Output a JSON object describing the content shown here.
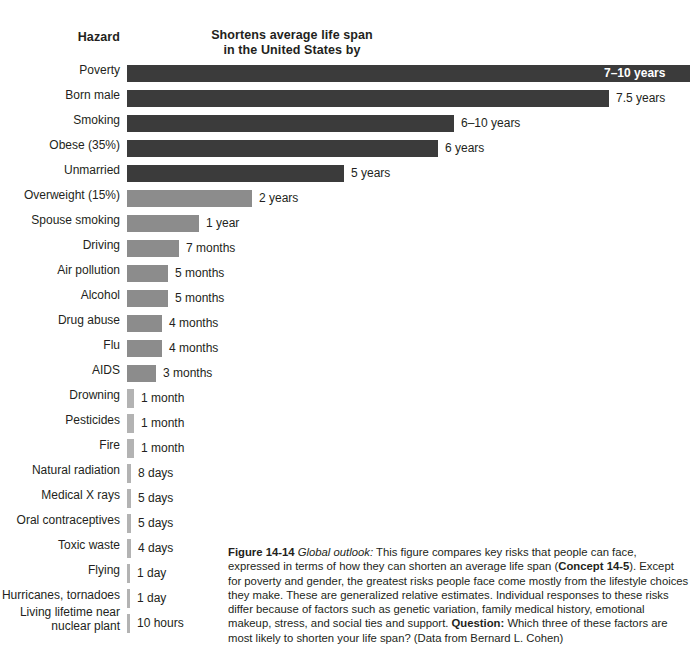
{
  "header": {
    "hazard_label": "Hazard",
    "axis_label_line1": "Shortens average life span",
    "axis_label_line2": "in the United States by"
  },
  "colors": {
    "dark_bar": "#3b3b3b",
    "mid_bar": "#8c8c8c",
    "light_bar": "#b3b3b3",
    "text": "#231f20",
    "inside_label": "#ffffff",
    "background": "#ffffff"
  },
  "caption": {
    "figure_number": "Figure 14-14",
    "lead_italic": "Global outlook:",
    "text_part1": " This figure compares key risks that people can face, expressed in terms of how they can shorten an average life span (",
    "concept_ref": "Concept 14-5",
    "text_part2": "). Except for poverty and gender, the greatest risks people face come mostly from the lifestyle choices they make. These are generalized relative estimates. Individual responses to these risks differ because of factors such as genetic variation, family medical history, emotional makeup, stress, and social ties and support. ",
    "question_label": "Question:",
    "text_part3": " Which three of these factors are most likely to shorten your life span? (Data from Bernard L. Cohen)"
  },
  "chart_data": {
    "type": "bar",
    "title": "Shortens average life span in the United States by",
    "xlabel": "Shortens average life span in the United States by",
    "ylabel": "Hazard",
    "orientation": "horizontal",
    "grid": false,
    "legend": false,
    "categories": [
      "Poverty",
      "Born male",
      "Smoking",
      "Obese (35%)",
      "Unmarried",
      "Overweight (15%)",
      "Spouse smoking",
      "Driving",
      "Air pollution",
      "Alcohol",
      "Drug abuse",
      "Flu",
      "AIDS",
      "Drowning",
      "Pesticides",
      "Fire",
      "Natural radiation",
      "Medical X rays",
      "Oral contraceptives",
      "Toxic waste",
      "Flying",
      "Hurricanes, tornadoes",
      "Living lifetime near\nnuclear plant"
    ],
    "value_labels": [
      "7–10 years",
      "7.5 years",
      "6–10 years",
      "6 years",
      "5 years",
      "2 years",
      "1 year",
      "7 months",
      "5 months",
      "5 months",
      "4 months",
      "4 months",
      "3 months",
      "1 month",
      "1 month",
      "1 month",
      "8 days",
      "5 days",
      "5 days",
      "4 days",
      "1 day",
      "1 day",
      "10 hours"
    ],
    "values_days": [
      3103,
      2739,
      2922,
      2191,
      1826,
      730,
      365,
      213,
      152,
      152,
      122,
      122,
      91,
      30,
      30,
      30,
      8,
      5,
      5,
      4,
      1,
      1,
      0.42
    ],
    "bar_pixel_widths": [
      563,
      482,
      327,
      311,
      217,
      125,
      72,
      52,
      41,
      41,
      35,
      35,
      29,
      7,
      7,
      7,
      4,
      4,
      4,
      4,
      3,
      3,
      3
    ],
    "tiers": [
      "dark",
      "dark",
      "dark",
      "dark",
      "dark",
      "mid",
      "mid",
      "mid",
      "mid",
      "mid",
      "mid",
      "mid",
      "mid",
      "light",
      "light",
      "light",
      "light",
      "light",
      "light",
      "light",
      "light",
      "light",
      "light"
    ],
    "label_inside_bar": [
      true,
      false,
      false,
      false,
      false,
      false,
      false,
      false,
      false,
      false,
      false,
      false,
      false,
      false,
      false,
      false,
      false,
      false,
      false,
      false,
      false,
      false,
      false
    ]
  }
}
